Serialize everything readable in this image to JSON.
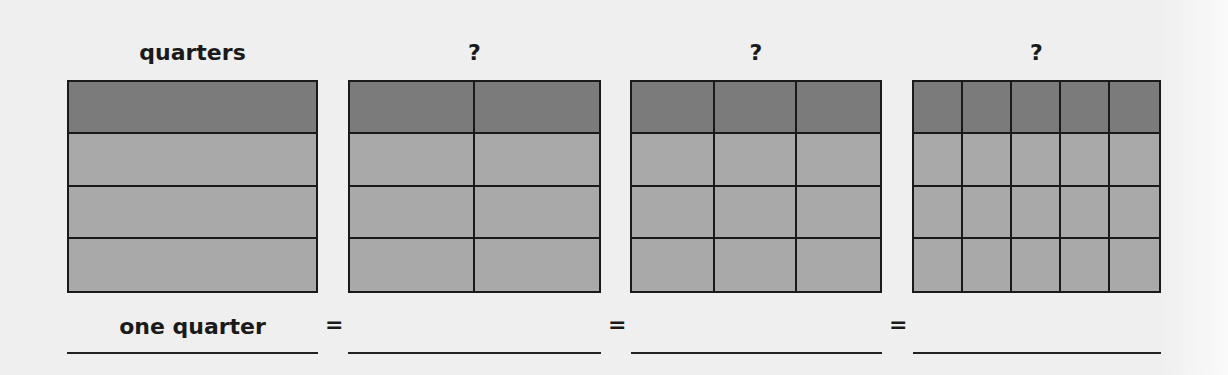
{
  "headings": [
    "quarters",
    "?",
    "?",
    "?"
  ],
  "grids": [
    {
      "rows": 4,
      "cols": 1,
      "shaded_rows": 1
    },
    {
      "rows": 4,
      "cols": 2,
      "shaded_rows": 1
    },
    {
      "rows": 4,
      "cols": 3,
      "shaded_rows": 1
    },
    {
      "rows": 4,
      "cols": 5,
      "shaded_rows": 1
    }
  ],
  "answers": [
    "one quarter",
    "",
    "",
    ""
  ],
  "equals": [
    "=",
    "=",
    "="
  ],
  "colors": {
    "shaded": "#7b7b7b",
    "unshaded": "#a9a9a9",
    "border": "#1a1a1a",
    "background": "#efefef"
  }
}
